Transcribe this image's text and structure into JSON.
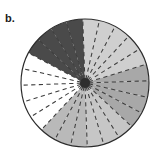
{
  "figure": {
    "panel_label": "b.",
    "caption": "",
    "background_color": "#ffffff"
  },
  "chart_data": {
    "type": "pie",
    "title": "",
    "subtitle": "",
    "xlabel": "",
    "ylabel": "",
    "legend_position": "none",
    "grid": false,
    "center_x": 85,
    "center_y": 83,
    "radius": 64,
    "sector_count": 24,
    "sector_angle_degrees": 15,
    "spoke_count": 24,
    "spoke_style": "dashed",
    "spoke_color": "#3d3d3d",
    "outline_color": "#2b2b2b",
    "hub_color": "#2e2e2e",
    "hub_radius": 5,
    "categories": [
      "0-15",
      "15-30",
      "30-45",
      "45-60",
      "60-75",
      "75-90",
      "90-105",
      "105-120",
      "120-135",
      "135-150",
      "150-165",
      "165-180",
      "180-195",
      "195-210",
      "210-225",
      "225-240",
      "240-255",
      "255-270",
      "270-285",
      "285-300",
      "300-315",
      "315-330",
      "330-345",
      "345-360"
    ],
    "values": [
      1,
      1,
      1,
      1,
      1,
      1,
      1,
      1,
      1,
      1,
      1,
      1,
      1,
      1,
      1,
      1,
      1,
      1,
      1,
      1,
      1,
      1,
      1,
      1
    ],
    "sector_fills": [
      "#4a4a4a",
      "#4a4a4a",
      "#4a4a4a",
      "#4a4a4a",
      "#cfcfcf",
      "#cfcfcf",
      "#cfcfcf",
      "#cfcfcf",
      "#cfcfcf",
      "#a8a8a8",
      "#a8a8a8",
      "#a8a8a8",
      "#a8a8a8",
      "#c6c6c6",
      "#c6c6c6",
      "#c6c6c6",
      "#b9b9b9",
      "#b9b9b9",
      "#b9b9b9",
      "#ffffff",
      "#ffffff",
      "#ffffff",
      "#ffffff",
      "#ffffff"
    ],
    "shade_groups": [
      {
        "name": "white-band",
        "color": "#ffffff",
        "start_deg": -62,
        "end_deg": 13,
        "sector_span": 5
      },
      {
        "name": "dark-gray-band",
        "color": "#4a4a4a",
        "start_deg": 13,
        "end_deg": 73,
        "sector_span": 4
      },
      {
        "name": "light-gray-band-right",
        "color": "#cfcfcf",
        "start_deg": 73,
        "end_deg": 148,
        "sector_span": 5
      },
      {
        "name": "medium-gray-band-bottom",
        "color": "#a8a8a8",
        "start_deg": 148,
        "end_deg": 208,
        "sector_span": 4
      },
      {
        "name": "light-gray-band-left",
        "color": "#c6c6c6",
        "start_deg": 208,
        "end_deg": 253,
        "sector_span": 3
      },
      {
        "name": "mid-light-band-upper-left",
        "color": "#b9b9b9",
        "start_deg": 253,
        "end_deg": 298,
        "sector_span": 3
      }
    ],
    "palette": {
      "white": "#ffffff",
      "dark_gray": "#4a4a4a",
      "medium_gray": "#a8a8a8",
      "light_gray": "#cfcfcf",
      "pale_gray": "#c6c6c6",
      "mid_light_gray": "#b9b9b9",
      "outline": "#2b2b2b",
      "hub": "#2e2e2e"
    }
  }
}
